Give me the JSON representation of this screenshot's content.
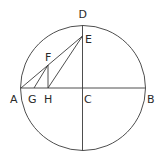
{
  "diagram": {
    "type": "geometric-construction",
    "colors": {
      "stroke": "#3a3a3a",
      "label": "#2a2a2a",
      "background": "#ffffff"
    },
    "points": [
      {
        "id": "A",
        "label": "A"
      },
      {
        "id": "B",
        "label": "B"
      },
      {
        "id": "C",
        "label": "C"
      },
      {
        "id": "D",
        "label": "D"
      },
      {
        "id": "E",
        "label": "E"
      },
      {
        "id": "F",
        "label": "F"
      },
      {
        "id": "G",
        "label": "G"
      },
      {
        "id": "H",
        "label": "H"
      }
    ],
    "segments": [
      [
        "A",
        "B"
      ],
      [
        "D",
        "C"
      ],
      [
        "A",
        "E"
      ],
      [
        "G",
        "E"
      ],
      [
        "H",
        "F"
      ],
      [
        "F",
        "G"
      ]
    ]
  }
}
